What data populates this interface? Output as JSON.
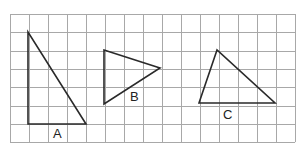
{
  "diagram": {
    "grid": {
      "left": 10,
      "top": 14,
      "cols": 15,
      "rows": 7,
      "cell_w": 19,
      "cell_h": 18.3,
      "line_color": "#a8a8a8"
    },
    "shapes": [
      {
        "id": "A",
        "label": "A",
        "type": "right-triangle",
        "points": [
          [
            28,
            32
          ],
          [
            28,
            124
          ],
          [
            86,
            124
          ]
        ],
        "label_pos": [
          53,
          138
        ]
      },
      {
        "id": "B",
        "label": "B",
        "type": "triangle",
        "points": [
          [
            104,
            50
          ],
          [
            160,
            68
          ],
          [
            104,
            104
          ]
        ],
        "label_pos": [
          130,
          101
        ]
      },
      {
        "id": "C",
        "label": "C",
        "type": "triangle",
        "points": [
          [
            217,
            50
          ],
          [
            199,
            103
          ],
          [
            275,
            103
          ]
        ],
        "label_pos": [
          223,
          119
        ]
      }
    ],
    "stroke_color": "#2a2a2a"
  }
}
